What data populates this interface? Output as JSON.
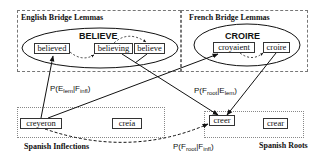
{
  "regions": {
    "english": {
      "label": "English Bridge Lemmas"
    },
    "french": {
      "label": "French Bridge Lemmas"
    },
    "spanish_inflections": {
      "label": "Spanish Inflections"
    },
    "spanish_roots": {
      "label": "Spanish Roots"
    }
  },
  "lemmas": {
    "english": {
      "title": "BELIEVE",
      "words": [
        "believed",
        "believing",
        "believe"
      ]
    },
    "french": {
      "title": "CROIRE",
      "words": [
        "croyaient",
        "croire"
      ]
    }
  },
  "spanish": {
    "inflections": [
      "creyeron",
      "creía"
    ],
    "roots": [
      "creer",
      "crear"
    ]
  },
  "probabilities": {
    "e_lem_given_f_infl": {
      "base": "P(E",
      "sub1": "lem",
      "mid": "|F",
      "sub2": "infl",
      "end": ")"
    },
    "f_root_given_e_lem": {
      "base": "P(F",
      "sub1": "root",
      "mid": "|E",
      "sub2": "lem",
      "end": ")"
    },
    "f_root_given_f_infl": {
      "base": "P(F",
      "sub1": "root",
      "mid": "|F",
      "sub2": "infl",
      "end": ")"
    }
  },
  "colors": {
    "line": "#111111",
    "region_border": "#777777"
  }
}
